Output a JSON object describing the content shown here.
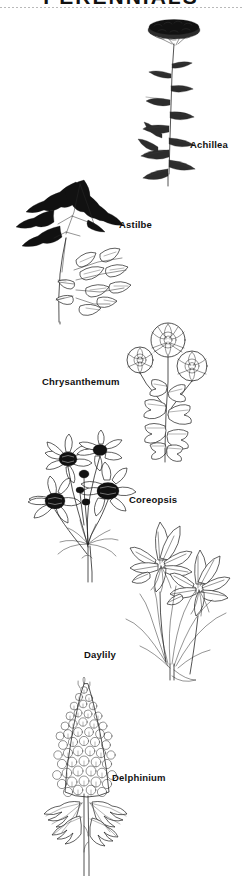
{
  "page": {
    "clipped_title": "PERENNIALS",
    "background_color": "#ffffff",
    "ink_color": "#1a1a1a",
    "width": 242,
    "height": 876
  },
  "plants": [
    {
      "id": "achillea",
      "label": "Achillea",
      "common_name": "Yarrow",
      "form": "flat-topped umbel on tall stem with fine ferny foliage"
    },
    {
      "id": "astilbe",
      "label": "Astilbe",
      "common_name": "False Spirea",
      "form": "feathery plume panicle with compound serrated leaves"
    },
    {
      "id": "chrysanthemum",
      "label": "Chrysanthemum",
      "common_name": "Mum",
      "form": "three pompon flower heads above deeply lobed leaves"
    },
    {
      "id": "coreopsis",
      "label": "Coreopsis",
      "common_name": "Tickseed",
      "form": "daisy-like blooms with dark centers on slender stems"
    },
    {
      "id": "daylily",
      "label": "Daylily",
      "common_name": "Hemerocallis",
      "form": "trumpet flowers above strap-shaped arching foliage"
    },
    {
      "id": "delphinium",
      "label": "Delphinium",
      "common_name": "Larkspur",
      "form": "tall dense flower spike with palmate lobed basal leaves"
    }
  ]
}
